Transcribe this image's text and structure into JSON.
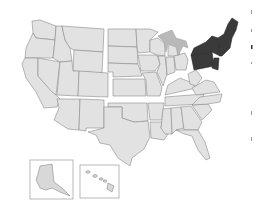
{
  "map": {
    "type": "choropleth",
    "subject": "United States census regions",
    "highlighted_region": "Northeast",
    "regions": [
      {
        "name": "West",
        "highlighted": false,
        "color": "#e2e2e2"
      },
      {
        "name": "Midwest",
        "highlighted": false,
        "color": "#e2e2e2"
      },
      {
        "name": "South",
        "highlighted": false,
        "color": "#e2e2e2"
      },
      {
        "name": "Northeast",
        "highlighted": true,
        "color": "#3a3a3a"
      }
    ],
    "insets": [
      {
        "name": "Alaska"
      },
      {
        "name": "Hawaii"
      }
    ],
    "colors": {
      "default_fill": "#e2e2e2",
      "highlight_fill": "#3a3a3a",
      "border": "#8a8a8a",
      "lakes": "#b9b9b9",
      "background": "#ffffff"
    }
  }
}
